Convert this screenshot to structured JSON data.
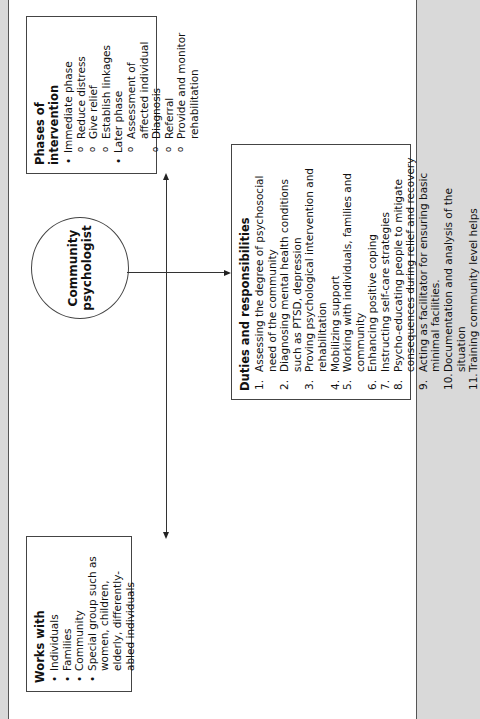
{
  "center": {
    "title_line1": "Community",
    "title_line2": "psychologist"
  },
  "works_with": {
    "heading": "Works with",
    "items": [
      "Individuals",
      "Families",
      "Community",
      "Special group such as women, children, elderly, differently-abled individuals"
    ]
  },
  "phases": {
    "heading": "Phases of intervention",
    "immediate": {
      "label": "Immediate phase",
      "items": [
        "Reduce distress",
        "Give relief",
        "Establish linkages"
      ]
    },
    "later": {
      "label": "Later phase",
      "items": [
        "Assessment of affected individual",
        "Diagnosis",
        "Referral",
        "Provide and monitor rehabilitation"
      ]
    }
  },
  "duties": {
    "heading": "Duties and responsibilities",
    "items": [
      {
        "n": "1.",
        "text": "Assessing the degree of psychosocial need of the community"
      },
      {
        "n": "2.",
        "text": "Diagnosing mental health conditions such as PTSD, depression"
      },
      {
        "n": "3.",
        "text": "Proving psychological intervention and rehabilitation"
      },
      {
        "n": "4.",
        "text": "Mobilizing support"
      },
      {
        "n": "5.",
        "text": "Working with individuals, families and community"
      },
      {
        "n": "6.",
        "text": "Enhancing positive coping"
      },
      {
        "n": "7.",
        "text": "Instructing self-care strategies"
      },
      {
        "n": "8.",
        "text": "Psycho-educating people to mitigate consequences during relief and recovery"
      },
      {
        "n": "9.",
        "text": "Acting as facilitator for ensuring basic minimal facilities."
      },
      {
        "n": "10.",
        "text": "Documentation and analysis of the situation"
      },
      {
        "n": "11.",
        "text": "Training community level helps"
      }
    ]
  }
}
